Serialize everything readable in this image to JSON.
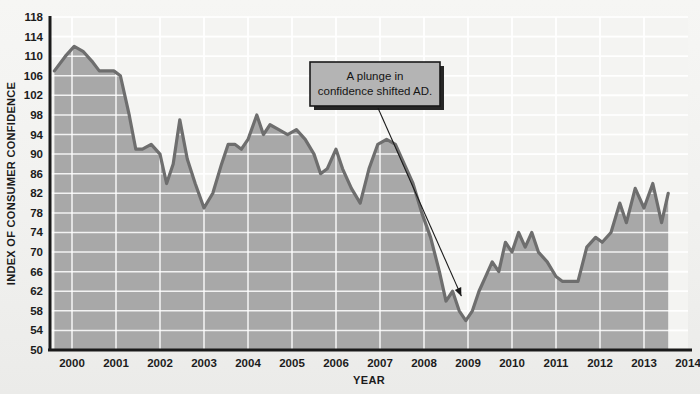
{
  "chart_data": {
    "type": "area",
    "title": "",
    "xlabel": "YEAR",
    "ylabel": "INDEX OF CONSUMER CONFIDENCE",
    "xlim": [
      1999.5,
      2014.0
    ],
    "ylim": [
      50,
      118
    ],
    "ytick_step": 4,
    "yticks": [
      50,
      54,
      58,
      62,
      66,
      70,
      74,
      78,
      82,
      86,
      90,
      94,
      98,
      102,
      106,
      110,
      114,
      118
    ],
    "xticks": [
      2000,
      2001,
      2002,
      2003,
      2004,
      2005,
      2006,
      2007,
      2008,
      2009,
      2010,
      2011,
      2012,
      2013,
      2014
    ],
    "grid": true,
    "legend": "none",
    "series_name": "Index of Consumer Confidence",
    "x": [
      1999.6,
      1999.85,
      2000.05,
      2000.25,
      2000.45,
      2000.62,
      2000.8,
      2000.95,
      2001.1,
      2001.3,
      2001.45,
      2001.6,
      2001.8,
      2002.0,
      2002.15,
      2002.3,
      2002.45,
      2002.62,
      2002.8,
      2003.0,
      2003.2,
      2003.4,
      2003.55,
      2003.7,
      2003.85,
      2004.0,
      2004.2,
      2004.35,
      2004.5,
      2004.7,
      2004.9,
      2005.1,
      2005.3,
      2005.5,
      2005.65,
      2005.8,
      2006.0,
      2006.15,
      2006.35,
      2006.55,
      2006.75,
      2006.95,
      2007.15,
      2007.35,
      2007.55,
      2007.75,
      2007.95,
      2008.15,
      2008.35,
      2008.5,
      2008.65,
      2008.8,
      2008.95,
      2009.1,
      2009.25,
      2009.4,
      2009.55,
      2009.7,
      2009.85,
      2010.0,
      2010.15,
      2010.3,
      2010.45,
      2010.6,
      2010.8,
      2011.0,
      2011.15,
      2011.3,
      2011.5,
      2011.7,
      2011.9,
      2012.05,
      2012.25,
      2012.45,
      2012.6,
      2012.8,
      2013.0,
      2013.2,
      2013.4,
      2013.55
    ],
    "values": [
      107,
      110,
      112,
      111,
      109,
      107,
      107,
      107,
      106,
      98,
      91,
      91,
      92,
      90,
      84,
      88,
      97,
      89,
      84,
      79,
      82,
      88,
      92,
      92,
      91,
      93,
      98,
      94,
      96,
      95,
      94,
      95,
      93,
      90,
      86,
      87,
      91,
      87,
      83,
      80,
      87,
      92,
      93,
      92,
      88,
      84,
      78,
      73,
      66,
      60,
      62,
      58,
      56,
      58,
      62,
      65,
      68,
      66,
      72,
      70,
      74,
      71,
      74,
      70,
      68,
      65,
      64,
      64,
      64,
      71,
      73,
      72,
      74,
      80,
      76,
      83,
      79,
      84,
      76,
      82
    ],
    "annotations": [
      {
        "name": "plunge-callout",
        "line1": "A plunge in",
        "line2": "confidence shifted AD.",
        "points_to_x": 2008.85,
        "points_to_y": 61
      }
    ],
    "colors": {
      "line": "#6e6e6e",
      "fill": "#a8a8a8",
      "plot_background": "#f4f4f2",
      "gridline": "#ffffff",
      "axis": "#1a1a1a",
      "annotation_box": "#b4b4b4",
      "annotation_border": "#1a1a1a",
      "text": "#1c1c1c"
    }
  }
}
